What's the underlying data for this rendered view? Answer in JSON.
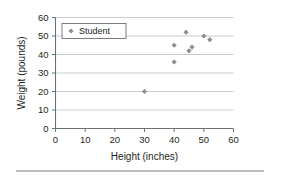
{
  "chart_data": {
    "type": "scatter",
    "title": "",
    "xlabel": "Height (inches)",
    "ylabel": "Weight (pounds)",
    "xlim": [
      0,
      60
    ],
    "ylim": [
      0,
      60
    ],
    "xticks": [
      0,
      10,
      20,
      30,
      40,
      50,
      60
    ],
    "yticks": [
      0,
      10,
      20,
      30,
      40,
      50,
      60
    ],
    "grid": "horizontal",
    "legend_position": "top-left",
    "series": [
      {
        "name": "Student",
        "marker": "diamond",
        "color": "#8b8f92",
        "points": [
          {
            "x": 30,
            "y": 20
          },
          {
            "x": 40,
            "y": 36
          },
          {
            "x": 40,
            "y": 45
          },
          {
            "x": 44,
            "y": 52
          },
          {
            "x": 45,
            "y": 42
          },
          {
            "x": 46,
            "y": 44
          },
          {
            "x": 50,
            "y": 50
          },
          {
            "x": 52,
            "y": 48
          }
        ]
      }
    ]
  },
  "legend": {
    "entries": [
      {
        "label": "Student",
        "marker_icon": "diamond-marker-icon"
      }
    ]
  },
  "colors": {
    "marker": "#8b8f92",
    "grid": "#c3c6c8",
    "axis": "#6d7073",
    "text": "#231f20",
    "rule": "#b9bcbe"
  }
}
